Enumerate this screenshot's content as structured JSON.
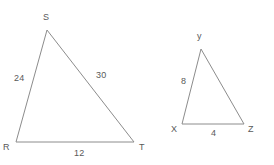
{
  "figure": {
    "type": "geometry-diagram",
    "background_color": "#ffffff",
    "stroke_color": "#8c8c8c",
    "text_color": "#595959"
  },
  "triangles": [
    {
      "id": "RST",
      "name": "triangle-rst",
      "vertices": [
        {
          "label": "S",
          "x": 47,
          "y": 30,
          "label_x": 43,
          "label_y": 12
        },
        {
          "label": "R",
          "x": 16,
          "y": 142,
          "label_x": 3,
          "label_y": 142
        },
        {
          "label": "T",
          "x": 134,
          "y": 142,
          "label_x": 139,
          "label_y": 142
        }
      ],
      "sides": [
        {
          "label": "24",
          "from": "R",
          "to": "S",
          "label_x": 14,
          "label_y": 73
        },
        {
          "label": "30",
          "from": "S",
          "to": "T",
          "label_x": 96,
          "label_y": 70
        },
        {
          "label": "12",
          "from": "R",
          "to": "T",
          "label_x": 74,
          "label_y": 148
        }
      ]
    },
    {
      "id": "XYZ",
      "name": "triangle-xyz",
      "vertices": [
        {
          "label": "y",
          "x": 201,
          "y": 49,
          "label_x": 197,
          "label_y": 31
        },
        {
          "label": "X",
          "x": 182,
          "y": 124,
          "label_x": 171,
          "label_y": 124
        },
        {
          "label": "Z",
          "x": 244,
          "y": 124,
          "label_x": 248,
          "label_y": 124
        }
      ],
      "sides": [
        {
          "label": "8",
          "from": "X",
          "to": "y",
          "label_x": 181,
          "label_y": 76
        },
        {
          "label": "4",
          "from": "X",
          "to": "Z",
          "label_x": 211,
          "label_y": 128
        }
      ]
    }
  ]
}
